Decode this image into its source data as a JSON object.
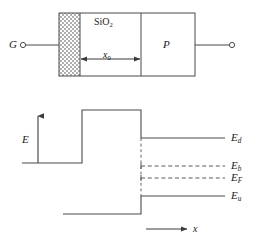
{
  "figure": {
    "caption": "",
    "colors": {
      "line": "#4a4a4a",
      "text": "#1a1a1a",
      "hatch": "#7a7a7a",
      "background": "#ffffff"
    }
  },
  "device": {
    "terminal_left_label": "G",
    "oxide_label": "SiO",
    "oxide_label_sub": "2",
    "semiconductor_label": "P",
    "thickness_label": "x",
    "thickness_label_sub": "0",
    "left_terminal_node": "open-circle",
    "right_terminal_node": "open-circle",
    "metal_region_fill": "dotted"
  },
  "band_diagram": {
    "y_axis_label": "E",
    "x_axis_label": "x",
    "levels": [
      {
        "id": "Ed",
        "symbol": "E",
        "subscript": "d",
        "style": "solid",
        "name": "donor-level"
      },
      {
        "id": "Eb",
        "symbol": "E",
        "subscript": "b",
        "style": "dashed",
        "name": "barrier-level"
      },
      {
        "id": "EF",
        "symbol": "E",
        "subscript": "F",
        "style": "dashed",
        "name": "fermi-level"
      },
      {
        "id": "Eu",
        "symbol": "E",
        "subscript": "u",
        "style": "solid",
        "name": "upper-valence-level"
      }
    ]
  }
}
